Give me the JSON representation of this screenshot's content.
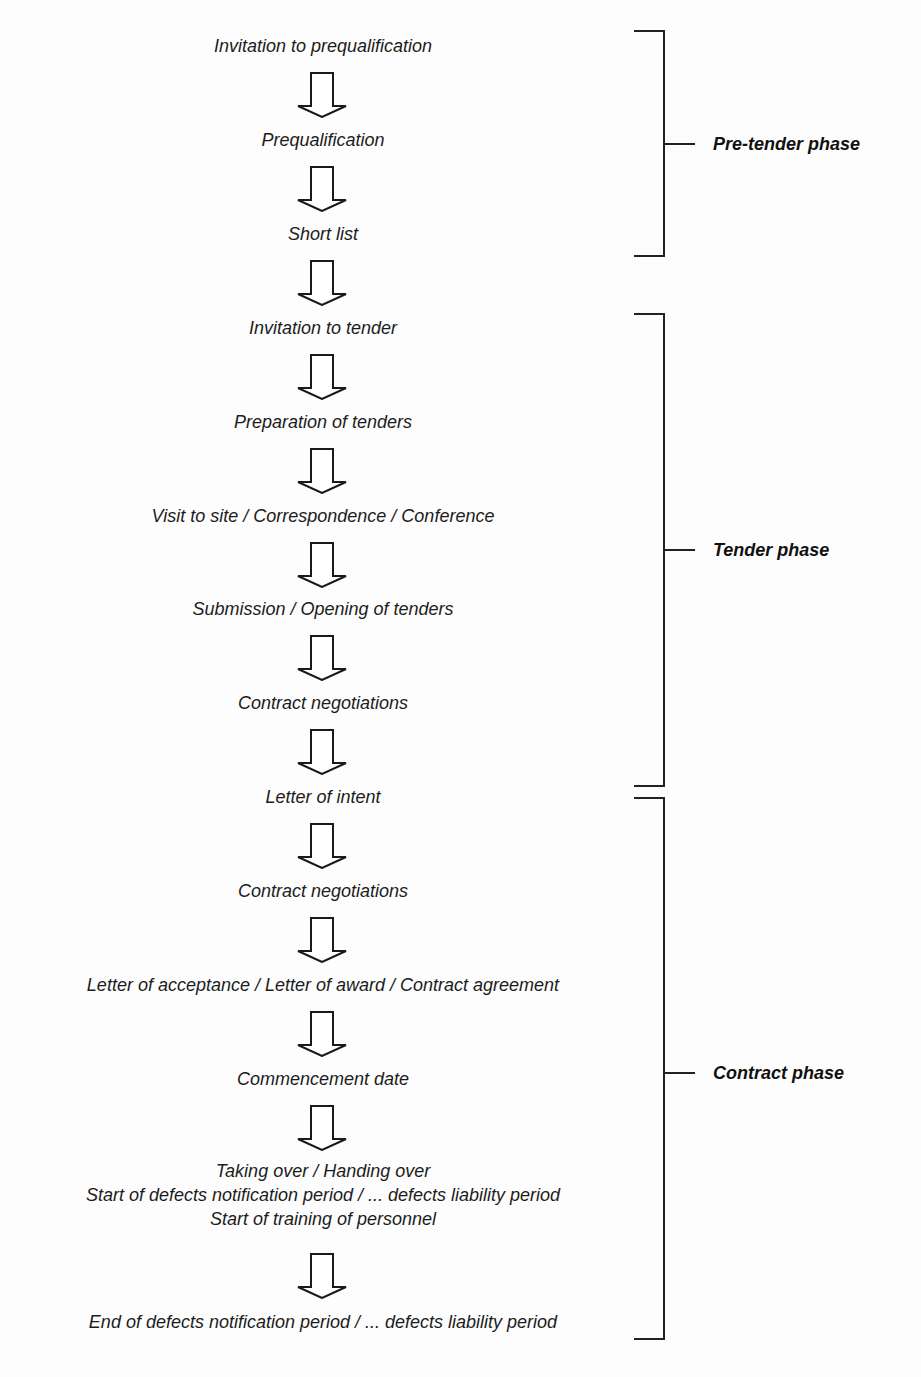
{
  "diagram": {
    "type": "vertical-flowchart",
    "steps": [
      {
        "label": "Invitation to prequalification"
      },
      {
        "label": "Prequalification"
      },
      {
        "label": "Short list"
      },
      {
        "label": "Invitation to tender"
      },
      {
        "label": "Preparation of tenders"
      },
      {
        "label": "Visit to site / Correspondence / Conference"
      },
      {
        "label": "Submission / Opening of tenders"
      },
      {
        "label": "Contract negotiations"
      },
      {
        "label": "Letter of intent"
      },
      {
        "label": "Contract negotiations"
      },
      {
        "label": "Letter of acceptance / Letter of award / Contract agreement"
      },
      {
        "label": "Commencement date"
      },
      {
        "lines": [
          "Taking over / Handing over",
          "Start of defects notification period / ... defects liability period",
          "Start of training of personnel"
        ]
      },
      {
        "label": "End of defects notification period / ... defects liability period"
      }
    ],
    "phases": [
      {
        "label": "Pre-tender phase"
      },
      {
        "label": "Tender phase"
      },
      {
        "label": "Contract phase"
      }
    ],
    "colors": {
      "text": "#1c1c1c",
      "lines": "#222222",
      "background": "#fdfdfd"
    }
  }
}
